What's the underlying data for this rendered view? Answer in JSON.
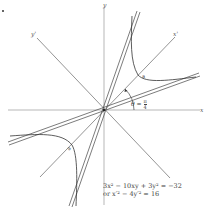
{
  "figure": {
    "type": "rotated-hyperbola",
    "marker": "•",
    "axes": {
      "x_label": "x",
      "y_label": "y",
      "x_prime_label": "x'",
      "y_prime_label": "y'"
    },
    "angle": {
      "symbol": "θ",
      "equals": "=",
      "numerator": "π",
      "denominator": "4"
    },
    "equation": {
      "line1": "3x² − 10xy + 3y² = −32",
      "line2": "or x′² − 4y′² = 16"
    },
    "colors": {
      "curve": "#333333",
      "axes": "#777777",
      "background": "#ffffff"
    }
  }
}
